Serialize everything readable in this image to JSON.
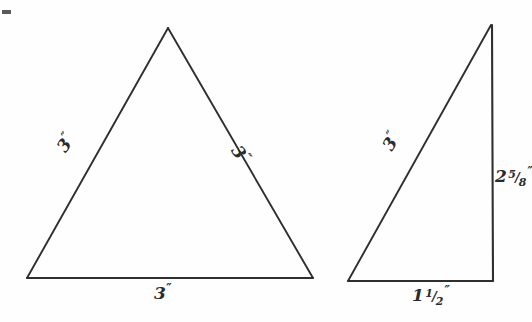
{
  "page": {
    "background_color": "#fefefe",
    "ink_color": "#2b2b2b",
    "width": 532,
    "height": 322,
    "artifact_name": "scan-mark"
  },
  "figures": [
    {
      "id": "equilateral-triangle",
      "kind": "equilateral-triangle",
      "vertices": {
        "apex": [
          168,
          28
        ],
        "bottom_left": [
          27,
          278
        ],
        "bottom_right": [
          313,
          278
        ]
      },
      "labels": {
        "left_side": {
          "number": "3",
          "fraction": "",
          "unit": "″"
        },
        "right_side": {
          "number": "3",
          "fraction": "",
          "unit": "″"
        },
        "base": {
          "number": "3",
          "fraction": "",
          "unit": "″"
        }
      }
    },
    {
      "id": "right-triangle",
      "kind": "right-triangle",
      "vertices": {
        "apex": [
          491,
          25
        ],
        "bottom_left": [
          348,
          281
        ],
        "right_angle": [
          493,
          281
        ]
      },
      "labels": {
        "hypotenuse": {
          "number": "3",
          "fraction": "",
          "unit": "″"
        },
        "vertical_leg": {
          "number": "2",
          "fraction_numerator": "5",
          "fraction_denominator": "8",
          "unit": "″"
        },
        "base": {
          "number": "1",
          "fraction_numerator": "1",
          "fraction_denominator": "2",
          "unit": "″"
        }
      }
    }
  ],
  "labels": {
    "left_tri_left_side_num": "3",
    "left_tri_left_side_unit": "″",
    "left_tri_right_side_num": "3",
    "left_tri_right_side_unit": "″",
    "left_tri_base_num": "3",
    "left_tri_base_unit": "″",
    "right_tri_hyp_num": "3",
    "right_tri_hyp_unit": "″",
    "right_tri_vertical_num": "2",
    "right_tri_vertical_frac_n": "5",
    "right_tri_vertical_frac_slash": "/",
    "right_tri_vertical_frac_d": "8",
    "right_tri_vertical_unit": "″",
    "right_tri_base_num": "1",
    "right_tri_base_frac_n": "1",
    "right_tri_base_frac_slash": "/",
    "right_tri_base_frac_d": "2",
    "right_tri_base_unit": "″"
  }
}
